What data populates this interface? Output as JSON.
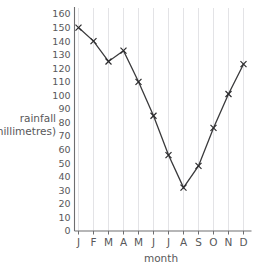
{
  "chart_data": {
    "type": "line",
    "title": "",
    "xlabel": "month",
    "ylabel": "rainfall (millimetres)",
    "ylabel_line1": "rainfall",
    "ylabel_line2": "(millimetres)",
    "categories": [
      "J",
      "F",
      "M",
      "A",
      "M",
      "J",
      "J",
      "A",
      "S",
      "O",
      "N",
      "D"
    ],
    "category_names": [
      "January",
      "February",
      "March",
      "April",
      "May",
      "June",
      "July",
      "August",
      "September",
      "October",
      "November",
      "December"
    ],
    "values": [
      150,
      140,
      125,
      133,
      110,
      85,
      56,
      32,
      48,
      76,
      101,
      123
    ],
    "ylim": [
      0,
      160
    ],
    "ytick_step": 10,
    "yticks": [
      160,
      150,
      140,
      130,
      120,
      110,
      100,
      90,
      80,
      70,
      60,
      50,
      40,
      30,
      20,
      10,
      0
    ],
    "grid": "vertical-only",
    "legend": "none",
    "marker": "x-cross",
    "line_color": "#3a3a3c",
    "grid_color": "#dcdce0",
    "axis_color": "#6e6e70",
    "text_color": "#58585a"
  }
}
